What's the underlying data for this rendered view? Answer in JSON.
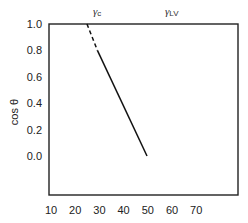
{
  "chart_data": {
    "type": "line",
    "title": "",
    "xlabel": "",
    "ylabel": "cos θ",
    "xlim": [
      10,
      80
    ],
    "ylim": [
      -0.3,
      1.0
    ],
    "x_ticks": [
      10,
      20,
      30,
      40,
      50,
      60,
      70
    ],
    "y_ticks": [
      0.0,
      0.2,
      0.4,
      0.6,
      0.8,
      1.0
    ],
    "x_tick_labels": [
      "10",
      "20",
      "30",
      "40",
      "50",
      "60",
      "70"
    ],
    "y_tick_labels": [
      "0.0",
      "0.2",
      "0.4",
      "0.6",
      "0.8",
      "1.0"
    ],
    "grid": false,
    "legend": null,
    "annotations": [
      {
        "text": "γc",
        "base": "γ",
        "sub": "c",
        "x": 25.7,
        "position": "top"
      },
      {
        "text": "γLV",
        "base": "γ",
        "sub": "LV",
        "x": 51,
        "position": "top"
      }
    ],
    "series": [
      {
        "name": "extrapolation",
        "style": "dashed",
        "x": [
          25.7,
          30.0
        ],
        "y": [
          1.0,
          0.8
        ]
      },
      {
        "name": "data fit",
        "style": "solid",
        "x": [
          30.0,
          50.5
        ],
        "y": [
          0.8,
          0.0
        ]
      }
    ]
  },
  "labels": {
    "ylabel": "cos θ",
    "top": [
      {
        "base": "γ",
        "sub": "c"
      },
      {
        "base": "γ",
        "sub": "LV"
      }
    ]
  }
}
